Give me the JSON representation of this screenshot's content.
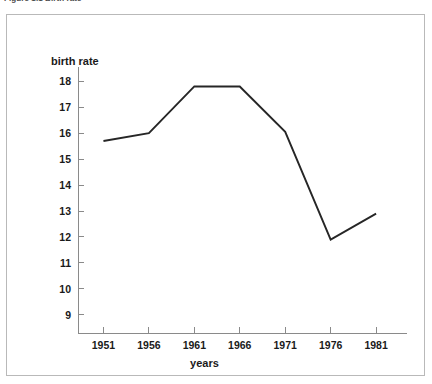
{
  "caption": {
    "text": "Figure 1.1   Birth rate"
  },
  "chart_data": {
    "type": "line",
    "title": "",
    "xlabel": "years",
    "ylabel": "birth rate",
    "categories": [
      "1951",
      "1956",
      "1961",
      "1966",
      "1971",
      "1976",
      "1981"
    ],
    "x": [
      1951,
      1956,
      1961,
      1966,
      1971,
      1976,
      1981
    ],
    "values": [
      15.7,
      16.0,
      17.8,
      17.8,
      16.05,
      11.9,
      12.9
    ],
    "series": [
      {
        "name": "birth rate",
        "values": [
          15.7,
          16.0,
          17.8,
          17.8,
          16.05,
          11.9,
          12.9
        ]
      }
    ],
    "ylim": [
      8.3,
      18.55
    ],
    "xlim": [
      1948.2,
      1984.4
    ],
    "yticks": [
      9,
      10,
      11,
      12,
      13,
      14,
      15,
      16,
      17,
      18
    ],
    "ytick_labels": [
      "9",
      "10",
      "11",
      "12",
      "13",
      "14",
      "15",
      "16",
      "17",
      "18"
    ],
    "xticks": [
      1951,
      1956,
      1961,
      1966,
      1971,
      1976,
      1981
    ],
    "xtick_labels": [
      "1951",
      "1956",
      "1961",
      "1966",
      "1971",
      "1976",
      "1981"
    ],
    "grid": false,
    "legend": false,
    "legend_position": "none",
    "line_color": "#262626",
    "axis_color": "#8a8a8a",
    "frame_color": "#b9b9b9",
    "background_color": "#ffffff"
  }
}
